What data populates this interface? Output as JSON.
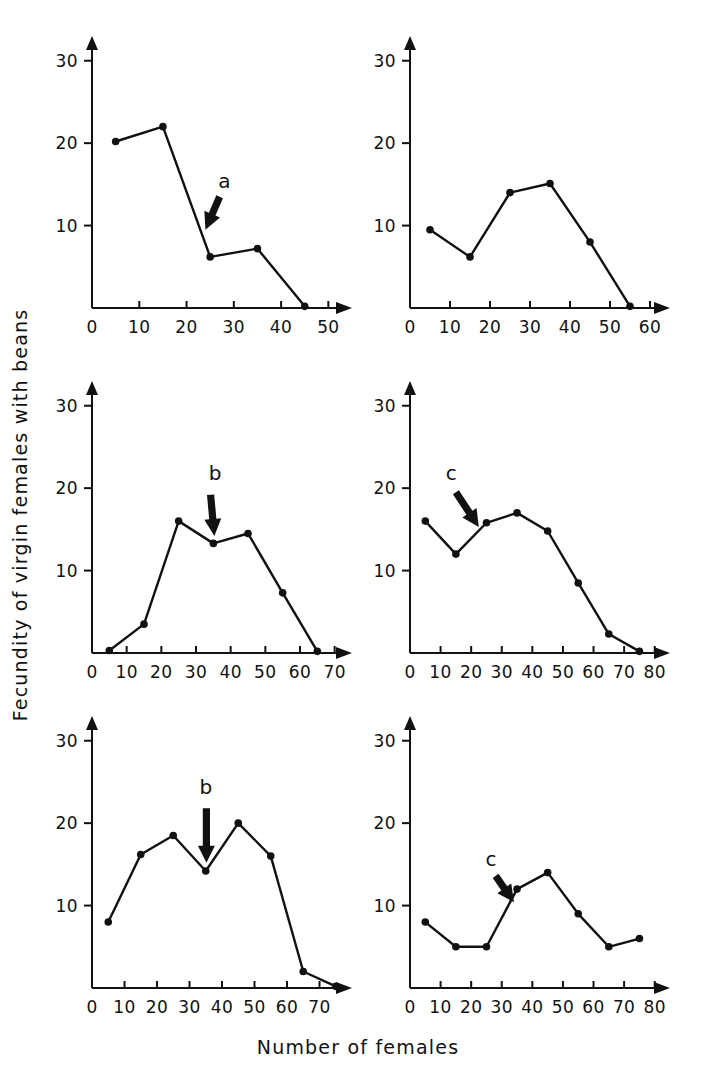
{
  "figure": {
    "ylabel": "Fecundity of virgin females with beans",
    "xlabel": "Number of females"
  },
  "chart_data": [
    {
      "type": "line",
      "panel_id": "top-left",
      "title": "",
      "xlabel": "Number of females",
      "ylabel": "Fecundity of virgin females with beans",
      "x": [
        5,
        15,
        25,
        35,
        45
      ],
      "values": [
        20.2,
        22.0,
        6.2,
        7.2,
        0.2
      ],
      "xlim": [
        0,
        55
      ],
      "ylim": [
        0,
        33
      ],
      "xticks": [
        0,
        10,
        20,
        30,
        40,
        50
      ],
      "yticks": [
        10,
        20,
        30
      ],
      "grid": false,
      "legend": "none",
      "annotations": [
        {
          "label": "a",
          "x": 28,
          "y": 14.5,
          "arrow_from_x": 27,
          "arrow_from_y": 13.5,
          "arrow_to_x": 24,
          "arrow_to_y": 9.5
        }
      ]
    },
    {
      "type": "line",
      "panel_id": "top-right",
      "title": "",
      "xlabel": "Number of females",
      "ylabel": "Fecundity of virgin females with beans",
      "x": [
        5,
        15,
        25,
        35,
        45,
        55
      ],
      "values": [
        9.5,
        6.2,
        14.0,
        15.1,
        8.0,
        0.2
      ],
      "xlim": [
        0,
        65
      ],
      "ylim": [
        0,
        33
      ],
      "xticks": [
        0,
        10,
        20,
        30,
        40,
        50,
        60
      ],
      "yticks": [
        10,
        20,
        30
      ],
      "grid": false,
      "legend": "none",
      "annotations": []
    },
    {
      "type": "line",
      "panel_id": "middle-left",
      "title": "",
      "xlabel": "Number of females",
      "ylabel": "Fecundity of virgin females with beans",
      "x": [
        5,
        15,
        25,
        35,
        45,
        55,
        65
      ],
      "values": [
        0.3,
        3.5,
        16.0,
        13.3,
        14.5,
        7.3,
        0.2
      ],
      "xlim": [
        0,
        75
      ],
      "ylim": [
        0,
        33
      ],
      "xticks": [
        0,
        10,
        20,
        30,
        40,
        50,
        60,
        70
      ],
      "yticks": [
        10,
        20,
        30
      ],
      "grid": false,
      "legend": "none",
      "annotations": [
        {
          "label": "b",
          "x": 35.5,
          "y": 21.0,
          "arrow_from_x": 34.2,
          "arrow_from_y": 19.2,
          "arrow_to_x": 35.3,
          "arrow_to_y": 14.2
        }
      ]
    },
    {
      "type": "line",
      "panel_id": "middle-right",
      "title": "",
      "xlabel": "Number of females",
      "ylabel": "Fecundity of virgin females with beans",
      "x": [
        5,
        15,
        25,
        35,
        45,
        55,
        65,
        75
      ],
      "values": [
        16.0,
        12.0,
        15.8,
        17.0,
        14.8,
        8.5,
        2.3,
        0.2
      ],
      "xlim": [
        0,
        85
      ],
      "ylim": [
        0,
        33
      ],
      "xticks": [
        0,
        10,
        20,
        30,
        40,
        50,
        60,
        70,
        80
      ],
      "yticks": [
        10,
        20,
        30
      ],
      "grid": false,
      "legend": "none",
      "annotations": [
        {
          "label": "c",
          "x": 13.5,
          "y": 21.0,
          "arrow_from_x": 15.0,
          "arrow_from_y": 19.5,
          "arrow_to_x": 22.5,
          "arrow_to_y": 15.3
        }
      ]
    },
    {
      "type": "line",
      "panel_id": "bottom-left",
      "title": "",
      "xlabel": "Number of females",
      "ylabel": "Fecundity of virgin females with beans",
      "x": [
        5,
        15,
        25,
        35,
        45,
        55,
        65,
        75
      ],
      "values": [
        8.0,
        16.2,
        18.5,
        14.2,
        20.0,
        16.0,
        2.0,
        0.2
      ],
      "xlim": [
        0,
        80
      ],
      "ylim": [
        0,
        33
      ],
      "xticks": [
        0,
        10,
        20,
        30,
        40,
        50,
        60,
        70
      ],
      "yticks": [
        10,
        20,
        30
      ],
      "grid": false,
      "legend": "none",
      "annotations": [
        {
          "label": "b",
          "x": 35.0,
          "y": 23.5,
          "arrow_from_x": 35.2,
          "arrow_from_y": 21.8,
          "arrow_to_x": 35.2,
          "arrow_to_y": 15.2
        }
      ]
    },
    {
      "type": "line",
      "panel_id": "bottom-right",
      "title": "",
      "xlabel": "Number of females",
      "ylabel": "Fecundity of virgin females with beans",
      "x": [
        5,
        15,
        25,
        35,
        45,
        55,
        65,
        75
      ],
      "values": [
        8.0,
        5.0,
        5.0,
        12.0,
        14.0,
        9.0,
        5.0,
        6.0
      ],
      "xlim": [
        0,
        85
      ],
      "ylim": [
        0,
        33
      ],
      "xticks": [
        0,
        10,
        20,
        30,
        40,
        50,
        60,
        70,
        80
      ],
      "yticks": [
        10,
        20,
        30
      ],
      "grid": false,
      "legend": "none",
      "annotations": [
        {
          "label": "c",
          "x": 26.5,
          "y": 14.8,
          "arrow_from_x": 28.0,
          "arrow_from_y": 13.6,
          "arrow_to_x": 34.0,
          "arrow_to_y": 10.4
        }
      ]
    }
  ],
  "panel_layout": [
    {
      "panel_id": "top-left",
      "left": 40,
      "top": 10,
      "width": 330,
      "height": 350
    },
    {
      "panel_id": "top-right",
      "left": 358,
      "top": 10,
      "width": 330,
      "height": 350
    },
    {
      "panel_id": "middle-left",
      "left": 40,
      "top": 355,
      "width": 330,
      "height": 350
    },
    {
      "panel_id": "middle-right",
      "left": 358,
      "top": 355,
      "width": 330,
      "height": 350
    },
    {
      "panel_id": "bottom-left",
      "left": 40,
      "top": 690,
      "width": 330,
      "height": 350
    },
    {
      "panel_id": "bottom-right",
      "left": 358,
      "top": 690,
      "width": 330,
      "height": 350
    }
  ]
}
